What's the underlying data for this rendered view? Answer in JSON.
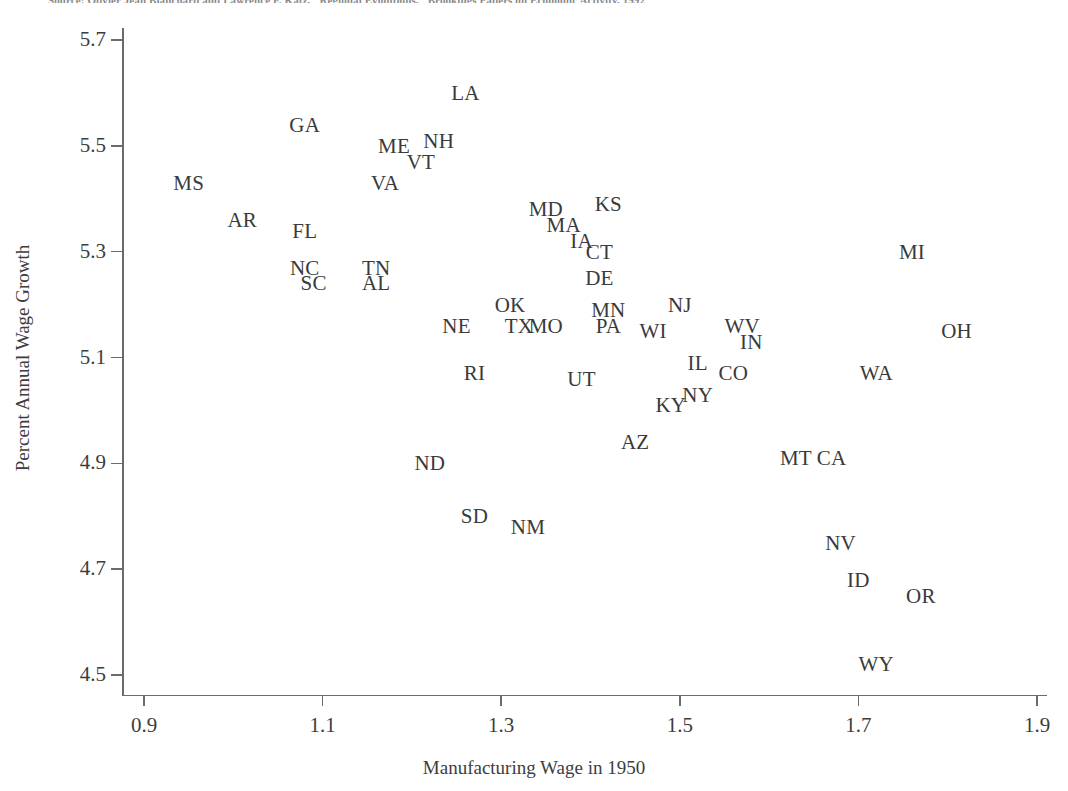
{
  "source_note": "Source: Olivier Jean Blanchard and Lawrence F. Katz, \"Regional Evolutions,\" Brookings Papers on Economic Activity, 1992",
  "axes": {
    "x_title": "Manufacturing Wage in 1950",
    "y_title": "Percent Annual Wage Growth",
    "x_ticks": [
      "0.9",
      "1.1",
      "1.3",
      "1.5",
      "1.7",
      "1.9"
    ],
    "y_ticks": [
      "5.7",
      "5.5",
      "5.3",
      "5.1",
      "4.9",
      "4.7",
      "4.5"
    ]
  },
  "chart_data": {
    "type": "scatter",
    "title": "",
    "xlabel": "Manufacturing Wage in 1950",
    "ylabel": "Percent Annual Wage Growth",
    "xlim": [
      0.88,
      1.92
    ],
    "ylim": [
      4.46,
      5.73
    ],
    "xticks": [
      0.9,
      1.1,
      1.3,
      1.5,
      1.7,
      1.9
    ],
    "yticks": [
      5.7,
      5.5,
      5.3,
      5.1,
      4.9,
      4.7,
      4.5
    ],
    "grid": false,
    "legend": false,
    "marker": "text-label",
    "point_label_field": "state",
    "points": [
      {
        "state": "LA",
        "x": 1.26,
        "y": 5.6
      },
      {
        "state": "GA",
        "x": 1.08,
        "y": 5.54
      },
      {
        "state": "ME",
        "x": 1.18,
        "y": 5.5
      },
      {
        "state": "NH",
        "x": 1.23,
        "y": 5.51
      },
      {
        "state": "VT",
        "x": 1.21,
        "y": 5.47
      },
      {
        "state": "MS",
        "x": 0.95,
        "y": 5.43
      },
      {
        "state": "VA",
        "x": 1.17,
        "y": 5.43
      },
      {
        "state": "MD",
        "x": 1.35,
        "y": 5.38
      },
      {
        "state": "KS",
        "x": 1.42,
        "y": 5.39
      },
      {
        "state": "AR",
        "x": 1.01,
        "y": 5.36
      },
      {
        "state": "MA",
        "x": 1.37,
        "y": 5.35
      },
      {
        "state": "FL",
        "x": 1.08,
        "y": 5.34
      },
      {
        "state": "IA",
        "x": 1.39,
        "y": 5.32
      },
      {
        "state": "CT",
        "x": 1.41,
        "y": 5.3
      },
      {
        "state": "MI",
        "x": 1.76,
        "y": 5.3
      },
      {
        "state": "NC",
        "x": 1.08,
        "y": 5.27
      },
      {
        "state": "TN",
        "x": 1.16,
        "y": 5.27
      },
      {
        "state": "DE",
        "x": 1.41,
        "y": 5.25
      },
      {
        "state": "SC",
        "x": 1.09,
        "y": 5.24
      },
      {
        "state": "AL",
        "x": 1.16,
        "y": 5.24
      },
      {
        "state": "OK",
        "x": 1.31,
        "y": 5.2
      },
      {
        "state": "MN",
        "x": 1.42,
        "y": 5.19
      },
      {
        "state": "NJ",
        "x": 1.5,
        "y": 5.2
      },
      {
        "state": "NE",
        "x": 1.25,
        "y": 5.16
      },
      {
        "state": "TX",
        "x": 1.32,
        "y": 5.16
      },
      {
        "state": "MO",
        "x": 1.35,
        "y": 5.16
      },
      {
        "state": "PA",
        "x": 1.42,
        "y": 5.16
      },
      {
        "state": "WI",
        "x": 1.47,
        "y": 5.15
      },
      {
        "state": "WV",
        "x": 1.57,
        "y": 5.16
      },
      {
        "state": "OH",
        "x": 1.81,
        "y": 5.15
      },
      {
        "state": "IN",
        "x": 1.58,
        "y": 5.13
      },
      {
        "state": "IL",
        "x": 1.52,
        "y": 5.09
      },
      {
        "state": "CO",
        "x": 1.56,
        "y": 5.07
      },
      {
        "state": "RI",
        "x": 1.27,
        "y": 5.07
      },
      {
        "state": "UT",
        "x": 1.39,
        "y": 5.06
      },
      {
        "state": "WA",
        "x": 1.72,
        "y": 5.07
      },
      {
        "state": "NY",
        "x": 1.52,
        "y": 5.03
      },
      {
        "state": "KY",
        "x": 1.49,
        "y": 5.01
      },
      {
        "state": "AZ",
        "x": 1.45,
        "y": 4.94
      },
      {
        "state": "ND",
        "x": 1.22,
        "y": 4.9
      },
      {
        "state": "MT",
        "x": 1.63,
        "y": 4.91
      },
      {
        "state": "CA",
        "x": 1.67,
        "y": 4.91
      },
      {
        "state": "SD",
        "x": 1.27,
        "y": 4.8
      },
      {
        "state": "NM",
        "x": 1.33,
        "y": 4.78
      },
      {
        "state": "NV",
        "x": 1.68,
        "y": 4.75
      },
      {
        "state": "ID",
        "x": 1.7,
        "y": 4.68
      },
      {
        "state": "OR",
        "x": 1.77,
        "y": 4.65
      },
      {
        "state": "WY",
        "x": 1.72,
        "y": 4.52
      }
    ]
  }
}
